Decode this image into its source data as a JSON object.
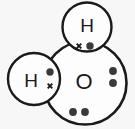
{
  "diagram": {
    "type": "dot-and-cross",
    "molecule": "H2O",
    "background_color": "#f7f7f7",
    "stroke_color": "#1a1a1a",
    "dot_color": "#3a3a3a",
    "canvas": {
      "width": 135,
      "height": 129
    },
    "atoms": [
      {
        "id": "oxygen",
        "label": "O",
        "element": "oxygen",
        "cx": 85,
        "cy": 83,
        "r": 41.5,
        "stroke_width": 2.6,
        "font_size": 22,
        "label_x": 84,
        "label_y": 81
      },
      {
        "id": "hydrogen-top",
        "label": "H",
        "element": "hydrogen",
        "cx": 87,
        "cy": 27,
        "r": 24.5,
        "stroke_width": 2.4,
        "font_size": 19,
        "label_x": 87,
        "label_y": 25
      },
      {
        "id": "hydrogen-left",
        "label": "H",
        "element": "hydrogen",
        "cx": 34,
        "cy": 79,
        "r": 26,
        "stroke_width": 2.4,
        "font_size": 19,
        "label_x": 31,
        "label_y": 80
      }
    ],
    "electrons": [
      {
        "id": "bond-top-cross",
        "kind": "cross",
        "group": "bonding-pair-top",
        "belongs_to": "hydrogen-top",
        "cx": 79,
        "cy": 46,
        "size": 4.6
      },
      {
        "id": "bond-top-dot",
        "kind": "dot",
        "group": "bonding-pair-top",
        "belongs_to": "oxygen",
        "cx": 90,
        "cy": 46,
        "size": 3.7
      },
      {
        "id": "bond-left-dot",
        "kind": "dot",
        "group": "bonding-pair-left",
        "belongs_to": "oxygen",
        "cx": 50,
        "cy": 72,
        "size": 3.7
      },
      {
        "id": "bond-left-cross",
        "kind": "cross",
        "group": "bonding-pair-left",
        "belongs_to": "hydrogen-left",
        "cx": 50,
        "cy": 86,
        "size": 4.6
      },
      {
        "id": "lone-right-upper",
        "kind": "dot",
        "group": "lone-pair-right",
        "belongs_to": "oxygen",
        "cx": 113,
        "cy": 71,
        "size": 3.9
      },
      {
        "id": "lone-right-lower",
        "kind": "dot",
        "group": "lone-pair-right",
        "belongs_to": "oxygen",
        "cx": 113,
        "cy": 83,
        "size": 3.9
      },
      {
        "id": "lone-bottom-left",
        "kind": "dot",
        "group": "lone-pair-bottom",
        "belongs_to": "oxygen",
        "cx": 73,
        "cy": 112,
        "size": 3.9
      },
      {
        "id": "lone-bottom-right",
        "kind": "dot",
        "group": "lone-pair-bottom",
        "belongs_to": "oxygen",
        "cx": 85,
        "cy": 112,
        "size": 3.9
      }
    ]
  }
}
